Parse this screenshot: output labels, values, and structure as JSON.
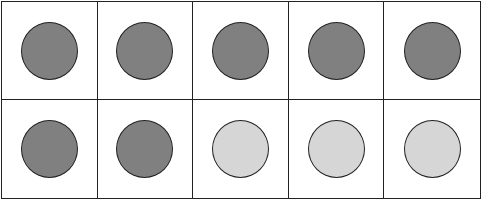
{
  "ten_frame": {
    "rows": 2,
    "columns": 5,
    "colors": {
      "dark": "#808080",
      "light": "#d6d6d6",
      "border": "#222222"
    },
    "cells": [
      {
        "fill": "dark"
      },
      {
        "fill": "dark"
      },
      {
        "fill": "dark"
      },
      {
        "fill": "dark"
      },
      {
        "fill": "dark"
      },
      {
        "fill": "dark"
      },
      {
        "fill": "dark"
      },
      {
        "fill": "light"
      },
      {
        "fill": "light"
      },
      {
        "fill": "light"
      }
    ],
    "dark_count": 7,
    "light_count": 3,
    "total": 10
  }
}
